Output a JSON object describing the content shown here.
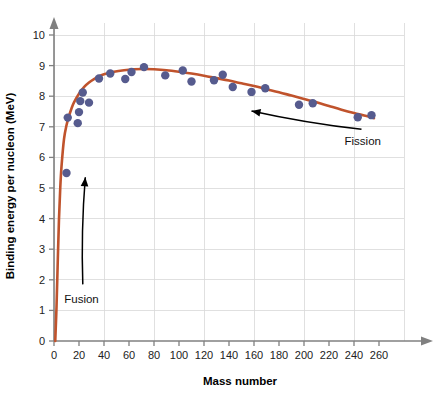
{
  "chart_data": {
    "type": "scatter",
    "title": "",
    "xlabel": "Mass number",
    "ylabel": "Binding energy per nucleon (MeV)",
    "xlim": [
      0,
      280
    ],
    "ylim": [
      0,
      10.6
    ],
    "xticks": [
      0,
      20,
      40,
      60,
      80,
      100,
      120,
      140,
      160,
      180,
      200,
      220,
      240,
      260
    ],
    "yticks": [
      0,
      1,
      2,
      3,
      4,
      5,
      6,
      7,
      8,
      9,
      10
    ],
    "grid": true,
    "grid_x_step": 40,
    "grid_y_step": 1,
    "legend": "none",
    "series": [
      {
        "name": "Measured nuclides",
        "type": "scatter",
        "marker_color": "#565b8e",
        "points": [
          {
            "x": 10,
            "y": 5.49
          },
          {
            "x": 11,
            "y": 7.3
          },
          {
            "x": 19,
            "y": 7.12
          },
          {
            "x": 20,
            "y": 7.48
          },
          {
            "x": 21,
            "y": 7.84
          },
          {
            "x": 23,
            "y": 8.12
          },
          {
            "x": 28,
            "y": 7.79
          },
          {
            "x": 36,
            "y": 8.58
          },
          {
            "x": 45,
            "y": 8.74
          },
          {
            "x": 57,
            "y": 8.56
          },
          {
            "x": 62,
            "y": 8.79
          },
          {
            "x": 72,
            "y": 8.95
          },
          {
            "x": 89,
            "y": 8.68
          },
          {
            "x": 103,
            "y": 8.84
          },
          {
            "x": 110,
            "y": 8.48
          },
          {
            "x": 128,
            "y": 8.52
          },
          {
            "x": 135,
            "y": 8.7
          },
          {
            "x": 143,
            "y": 8.3
          },
          {
            "x": 158,
            "y": 8.14
          },
          {
            "x": 169,
            "y": 8.26
          },
          {
            "x": 196,
            "y": 7.72
          },
          {
            "x": 207,
            "y": 7.77
          },
          {
            "x": 243,
            "y": 7.31
          },
          {
            "x": 254,
            "y": 7.38
          }
        ]
      },
      {
        "name": "Fitted binding energy curve",
        "type": "line",
        "line_color": "#c0532c",
        "points": [
          {
            "x": 1,
            "y": 0.0
          },
          {
            "x": 2,
            "y": 1.1
          },
          {
            "x": 3,
            "y": 2.6
          },
          {
            "x": 4,
            "y": 4.0
          },
          {
            "x": 5,
            "y": 5.0
          },
          {
            "x": 6,
            "y": 5.7
          },
          {
            "x": 8,
            "y": 6.6
          },
          {
            "x": 10,
            "y": 7.05
          },
          {
            "x": 12,
            "y": 7.35
          },
          {
            "x": 14,
            "y": 7.6
          },
          {
            "x": 16,
            "y": 7.8
          },
          {
            "x": 20,
            "y": 8.08
          },
          {
            "x": 24,
            "y": 8.3
          },
          {
            "x": 28,
            "y": 8.45
          },
          {
            "x": 32,
            "y": 8.56
          },
          {
            "x": 36,
            "y": 8.65
          },
          {
            "x": 40,
            "y": 8.72
          },
          {
            "x": 48,
            "y": 8.8
          },
          {
            "x": 56,
            "y": 8.85
          },
          {
            "x": 64,
            "y": 8.88
          },
          {
            "x": 72,
            "y": 8.89
          },
          {
            "x": 80,
            "y": 8.88
          },
          {
            "x": 90,
            "y": 8.85
          },
          {
            "x": 100,
            "y": 8.8
          },
          {
            "x": 110,
            "y": 8.74
          },
          {
            "x": 120,
            "y": 8.67
          },
          {
            "x": 130,
            "y": 8.59
          },
          {
            "x": 140,
            "y": 8.51
          },
          {
            "x": 150,
            "y": 8.42
          },
          {
            "x": 160,
            "y": 8.33
          },
          {
            "x": 170,
            "y": 8.23
          },
          {
            "x": 180,
            "y": 8.13
          },
          {
            "x": 190,
            "y": 8.02
          },
          {
            "x": 200,
            "y": 7.91
          },
          {
            "x": 210,
            "y": 7.8
          },
          {
            "x": 220,
            "y": 7.68
          },
          {
            "x": 230,
            "y": 7.56
          },
          {
            "x": 240,
            "y": 7.45
          },
          {
            "x": 250,
            "y": 7.35
          },
          {
            "x": 256,
            "y": 7.28
          }
        ]
      }
    ],
    "annotations": [
      {
        "label": "Fusion",
        "label_x": 22,
        "label_y": 1.25,
        "arrow_from_x": 23,
        "arrow_from_y": 1.85,
        "arrow_to_x": 25,
        "arrow_to_y": 5.35
      },
      {
        "label": "Fission",
        "label_x": 247,
        "label_y": 6.4,
        "arrow_from_x": 246,
        "arrow_from_y": 6.92,
        "arrow_to_x": 158,
        "arrow_to_y": 7.52
      }
    ],
    "colors": {
      "curve": "#c0532c",
      "marker": "#565b8e",
      "grid": "#d8d8d8",
      "axis": "#808080",
      "text": "#111111",
      "background": "#ffffff"
    }
  }
}
